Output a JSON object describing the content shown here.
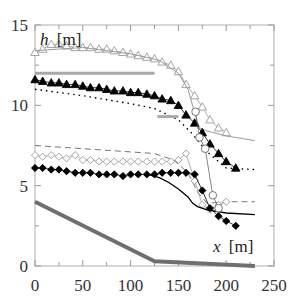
{
  "chart_data": {
    "type": "line",
    "title": "",
    "xlabel": "x [m]",
    "ylabel": "h [m]",
    "xlim": [
      0,
      250
    ],
    "ylim": [
      0,
      15
    ],
    "xticks": [
      0,
      50,
      100,
      150,
      200,
      250
    ],
    "yticks": [
      0,
      5,
      10,
      15
    ],
    "grid": false,
    "legend": "none",
    "series": [
      {
        "name": "upper-open-triangles",
        "marker": "open-triangle",
        "color": "#9a9a9a",
        "x": [
          0,
          8,
          17,
          25,
          33,
          42,
          50,
          58,
          67,
          75,
          83,
          92,
          100,
          108,
          117,
          125,
          133,
          142,
          150,
          158,
          167,
          175,
          183,
          192,
          200
        ],
        "y": [
          13.3,
          13.5,
          13.8,
          13.8,
          13.7,
          13.6,
          13.6,
          13.6,
          13.5,
          13.5,
          13.4,
          13.3,
          13.2,
          13.1,
          13.0,
          12.9,
          12.7,
          12.5,
          12.1,
          11.3,
          10.6,
          9.9,
          9.1,
          8.6,
          8.3
        ]
      },
      {
        "name": "upper-thin-line",
        "marker": "none",
        "color": "#9a9a9a",
        "x": [
          0,
          50,
          100,
          130,
          150,
          160,
          167,
          172,
          180,
          200,
          230
        ],
        "y": [
          13.4,
          13.6,
          13.2,
          12.8,
          12.0,
          11.0,
          9.5,
          8.6,
          8.4,
          8.1,
          7.8
        ]
      },
      {
        "name": "lower-filled-triangles",
        "marker": "filled-triangle",
        "color": "#000000",
        "x": [
          0,
          8,
          17,
          25,
          33,
          42,
          50,
          58,
          67,
          75,
          83,
          92,
          100,
          108,
          117,
          125,
          133,
          142,
          150,
          158,
          167,
          175,
          183,
          192,
          200,
          210
        ],
        "y": [
          11.6,
          11.5,
          11.4,
          11.4,
          11.3,
          11.3,
          11.2,
          11.1,
          11.1,
          11.0,
          10.9,
          10.9,
          10.8,
          10.8,
          10.7,
          10.6,
          10.4,
          10.3,
          10.0,
          9.4,
          8.9,
          8.3,
          7.6,
          7.0,
          6.5,
          6.1
        ]
      },
      {
        "name": "dotted-line",
        "marker": "none",
        "color": "#000000",
        "x": [
          0,
          50,
          100,
          125,
          150,
          165,
          180,
          200,
          230
        ],
        "y": [
          11.0,
          10.6,
          10.1,
          9.8,
          9.1,
          8.2,
          7.1,
          6.1,
          6.0
        ]
      },
      {
        "name": "reference-bar-upper",
        "marker": "thick-gray-segment",
        "color": "#a9a9a9",
        "x": [
          0,
          125
        ],
        "y": [
          12.0,
          12.0
        ]
      },
      {
        "name": "reference-bar-lower",
        "marker": "thick-gray-segment",
        "color": "#a9a9a9",
        "x": [
          128,
          150
        ],
        "y": [
          9.3,
          9.3
        ]
      },
      {
        "name": "dashed-line",
        "marker": "none",
        "color": "#777777",
        "x": [
          0,
          50,
          100,
          125,
          145,
          160,
          170,
          180,
          200,
          230
        ],
        "y": [
          7.5,
          7.3,
          7.1,
          7.0,
          6.6,
          5.8,
          4.6,
          3.9,
          4.0,
          4.0
        ]
      },
      {
        "name": "open-diamonds",
        "marker": "open-diamond",
        "color": "#9a9a9a",
        "x": [
          0,
          8,
          17,
          25,
          33,
          42,
          50,
          58,
          67,
          75,
          83,
          92,
          100,
          108,
          117,
          125,
          133,
          142,
          150,
          158,
          167,
          175,
          183,
          192,
          200
        ],
        "y": [
          6.9,
          6.8,
          6.9,
          6.8,
          6.7,
          6.9,
          6.6,
          6.6,
          6.5,
          6.5,
          6.5,
          6.5,
          6.5,
          6.5,
          6.5,
          6.5,
          6.5,
          6.5,
          6.6,
          7.0,
          5.3,
          3.8,
          3.5,
          3.8,
          4.0
        ]
      },
      {
        "name": "filled-diamonds",
        "marker": "filled-diamond",
        "color": "#000000",
        "x": [
          0,
          8,
          17,
          25,
          33,
          42,
          50,
          58,
          67,
          75,
          83,
          92,
          100,
          108,
          117,
          125,
          133,
          142,
          150,
          158,
          167,
          175,
          183,
          192,
          200,
          210
        ],
        "y": [
          6.1,
          6.1,
          6.0,
          6.0,
          5.9,
          5.8,
          5.8,
          5.8,
          5.7,
          5.7,
          5.7,
          5.6,
          5.7,
          5.7,
          5.7,
          5.7,
          5.8,
          5.8,
          5.8,
          5.8,
          5.7,
          4.7,
          3.6,
          3.1,
          2.8,
          2.5
        ]
      },
      {
        "name": "solid-line",
        "marker": "none",
        "color": "#000000",
        "x": [
          118,
          130,
          140,
          150,
          160,
          165,
          170,
          180,
          200,
          230
        ],
        "y": [
          5.7,
          5.5,
          5.2,
          4.8,
          4.3,
          3.9,
          3.7,
          3.5,
          3.3,
          3.2
        ]
      },
      {
        "name": "open-circles",
        "marker": "open-circle",
        "color": "#666666",
        "x": [
          168,
          172,
          178,
          186,
          192
        ],
        "y": [
          9.6,
          8.0,
          7.3,
          4.4,
          3.6
        ]
      },
      {
        "name": "bed-profile",
        "marker": "thick-gray-line",
        "color": "#6f6f6f",
        "x": [
          0,
          125,
          230
        ],
        "y": [
          4.0,
          0.3,
          0.0
        ]
      }
    ]
  },
  "axes": {
    "x_title_italic": "x",
    "x_title_unit": "[m]",
    "y_title_italic": "h",
    "y_title_unit": "[m]",
    "x_tick_labels": [
      "0",
      "50",
      "100",
      "150",
      "200",
      "250"
    ],
    "y_tick_labels": [
      "0",
      "5",
      "10",
      "15"
    ]
  }
}
